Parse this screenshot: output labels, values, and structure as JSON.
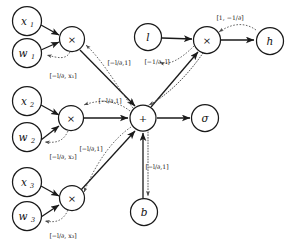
{
  "diagram": {
    "nodes": {
      "x1": {
        "label": "x",
        "sub": "1"
      },
      "w1": {
        "label": "w",
        "sub": "1"
      },
      "mul1": {
        "label": "×"
      },
      "x2": {
        "label": "x",
        "sub": "2"
      },
      "w2": {
        "label": "w",
        "sub": "2"
      },
      "mul2": {
        "label": "×"
      },
      "x3": {
        "label": "x",
        "sub": "3"
      },
      "w3": {
        "label": "w",
        "sub": "3"
      },
      "mul3": {
        "label": "×"
      },
      "plus": {
        "label": "+"
      },
      "sigma": {
        "label": "σ"
      },
      "b": {
        "label": "b"
      },
      "l": {
        "label": "l"
      },
      "mulTop": {
        "label": "×"
      },
      "h": {
        "label": "h"
      }
    },
    "gradient_labels": {
      "g_x1": "[−l/∂, x₁]",
      "g_x2": "[−l/∂, x₂]",
      "g_x3": "[−l/∂, x₃]",
      "g_mul1_to_plus": "[−l/∂,1]",
      "g_mul2_to_plus": "[−l/∂,1]",
      "g_mul3_to_plus": "[−l/∂,1]",
      "g_b_to_plus": "[−l/∂,1]",
      "g_l_to_mulTop": "[−1/∂, l]",
      "g_h_to_mulTop": "[1, −1/∂]"
    },
    "colors": {
      "background": "#ffffff",
      "stroke": "#1a1a1a",
      "gradient_stroke": "#4a4a4a",
      "text": "#111111"
    }
  }
}
